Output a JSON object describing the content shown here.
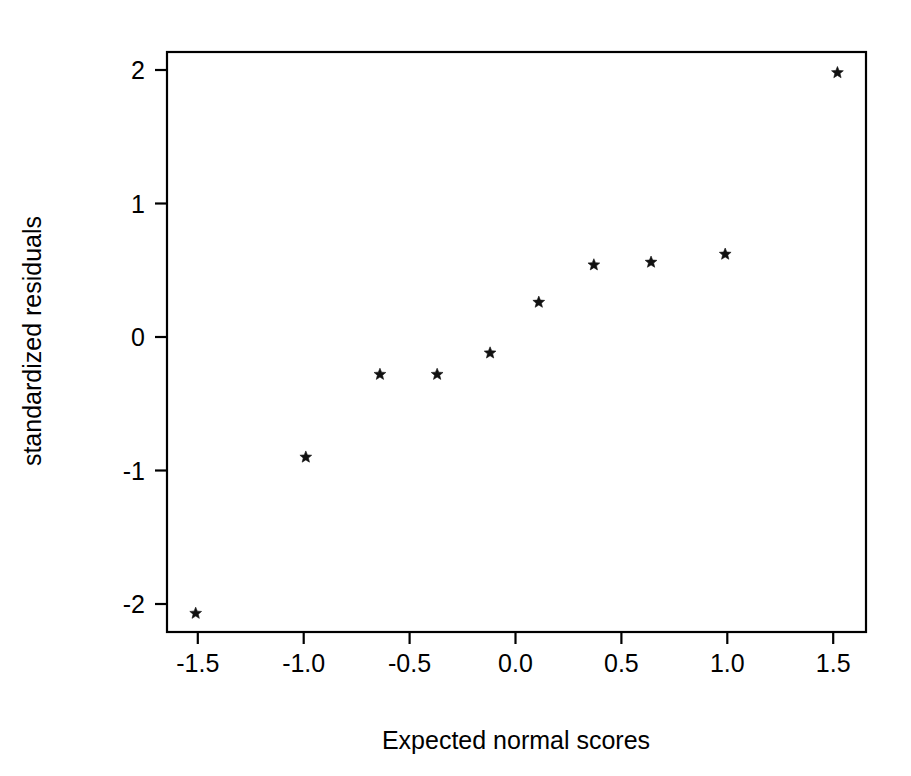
{
  "chart_data": {
    "type": "scatter",
    "title": "",
    "subtitle": "",
    "xlabel": "Expected normal scores",
    "ylabel": "standardized residuals",
    "xlim": [
      -1.64,
      1.65
    ],
    "ylim": [
      -2.16,
      2.1
    ],
    "xticks": [
      -1.5,
      -1.0,
      -0.5,
      0.0,
      0.5,
      1.0,
      1.5
    ],
    "xtick_labels": [
      "-1.5",
      "-1.0",
      "-0.5",
      "0.0",
      "0.5",
      "1.0",
      "1.5"
    ],
    "yticks": [
      -2,
      -1,
      0,
      1,
      2
    ],
    "ytick_labels": [
      "-2",
      "-1",
      "0",
      "1",
      "2"
    ],
    "grid": false,
    "legend": null,
    "marker": "star",
    "marker_color": "#111111",
    "series": [
      {
        "name": "standardized residuals",
        "x": [
          -1.51,
          -0.99,
          -0.64,
          -0.37,
          -0.12,
          0.11,
          0.37,
          0.64,
          0.99,
          1.52
        ],
        "y": [
          -2.07,
          -0.9,
          -0.28,
          -0.28,
          -0.12,
          0.26,
          0.54,
          0.56,
          0.62,
          1.98
        ]
      }
    ],
    "annotations": []
  },
  "figure": {
    "background_color": "#ffffff",
    "frame_color": "#000000",
    "plot_frame": {
      "left": 167,
      "top": 52,
      "right": 866,
      "bottom": 632
    }
  }
}
